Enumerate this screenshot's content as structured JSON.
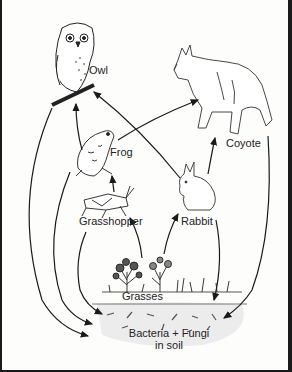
{
  "diagram": {
    "type": "food-web",
    "nodes": {
      "owl": {
        "label": "Owl"
      },
      "coyote": {
        "label": "Coyote"
      },
      "frog": {
        "label": "Frog"
      },
      "grasshopper": {
        "label": "Grasshopper"
      },
      "rabbit": {
        "label": "Rabbit"
      },
      "grasses": {
        "label": "Grasses"
      },
      "decomposers": {
        "label_line1": "Bacteria + Fungi",
        "label_line2": "in soil"
      }
    },
    "edges": [
      {
        "from": "Frog",
        "to": "Owl"
      },
      {
        "from": "Rabbit",
        "to": "Owl"
      },
      {
        "from": "Frog",
        "to": "Coyote"
      },
      {
        "from": "Rabbit",
        "to": "Coyote"
      },
      {
        "from": "Grasshopper",
        "to": "Frog"
      },
      {
        "from": "Grasses",
        "to": "Grasshopper"
      },
      {
        "from": "Grasses",
        "to": "Rabbit"
      },
      {
        "from": "Owl",
        "to": "Bacteria + Fungi in soil"
      },
      {
        "from": "Frog",
        "to": "Bacteria + Fungi in soil"
      },
      {
        "from": "Grasshopper",
        "to": "Bacteria + Fungi in soil"
      },
      {
        "from": "Rabbit",
        "to": "Bacteria + Fungi in soil"
      },
      {
        "from": "Coyote",
        "to": "Bacteria + Fungi in soil"
      }
    ],
    "colors": {
      "ink": "#1a1a1a",
      "background": "#fdfdfc",
      "soil": "#d8d8d8"
    }
  }
}
